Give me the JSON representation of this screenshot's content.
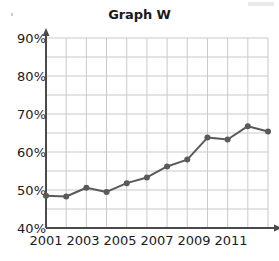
{
  "chart_data": {
    "type": "line",
    "title": "Graph W",
    "xlabel": "",
    "ylabel": "",
    "x": [
      2001,
      2002,
      2003,
      2004,
      2005,
      2006,
      2007,
      2008,
      2009,
      2010,
      2011,
      2012
    ],
    "values": [
      48.5,
      48.3,
      50.6,
      49.5,
      51.8,
      53.3,
      56.2,
      58.0,
      63.8,
      63.3,
      66.8,
      65.4
    ],
    "series": [
      {
        "name": "Graph W",
        "values": [
          48.5,
          48.3,
          50.6,
          49.5,
          51.8,
          53.3,
          56.2,
          58.0,
          63.8,
          63.3,
          66.8,
          65.4
        ]
      }
    ],
    "ylim": [
      40,
      90
    ],
    "xlim": [
      2001,
      2012
    ],
    "ytick_labels": [
      "40%",
      "50%",
      "60%",
      "70%",
      "80%",
      "90%"
    ],
    "ytick_values": [
      40,
      50,
      60,
      70,
      80,
      90
    ],
    "yminor_step": 5,
    "xtick_labels": [
      "2001",
      "2003",
      "2005",
      "2007",
      "2009",
      "2011"
    ],
    "xtick_values": [
      2001,
      2003,
      2005,
      2007,
      2009,
      2011
    ],
    "grid": true,
    "legend": "none",
    "value_suffix": "%",
    "line_color": "#5a5a5a",
    "marker_color": "#5a5a5a",
    "grid_color": "#c9c9c9",
    "axis_color": "#4a4a4a",
    "text_color": "#1a1a1a"
  },
  "axes": {
    "y_arrow": true,
    "x_arrow": true
  }
}
